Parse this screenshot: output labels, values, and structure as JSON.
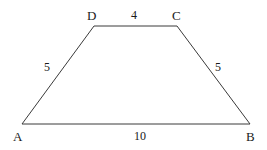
{
  "figure": {
    "type": "geometry-diagram",
    "shape": "trapezoid",
    "background_color": "#ffffff",
    "stroke_color": "#3a3a3a",
    "stroke_width": 1,
    "canvas": {
      "width": 267,
      "height": 150
    },
    "vertices": [
      {
        "name": "A",
        "label": "A",
        "x": 22,
        "y": 124,
        "label_x": 13,
        "label_y": 130
      },
      {
        "name": "B",
        "label": "B",
        "x": 250,
        "y": 124,
        "label_x": 246,
        "label_y": 130
      },
      {
        "name": "C",
        "label": "C",
        "x": 177,
        "y": 26,
        "label_x": 172,
        "label_y": 9
      },
      {
        "name": "D",
        "label": "D",
        "x": 94,
        "y": 26,
        "label_x": 87,
        "label_y": 9
      }
    ],
    "edges": [
      {
        "name": "edge-AB",
        "from": "A",
        "to": "B",
        "length_label": "10",
        "label_x": 134,
        "label_y": 130
      },
      {
        "name": "edge-DC",
        "from": "D",
        "to": "C",
        "length_label": "4",
        "label_x": 131,
        "label_y": 9
      },
      {
        "name": "edge-AD",
        "from": "A",
        "to": "D",
        "length_label": "5",
        "label_x": 44,
        "label_y": 61
      },
      {
        "name": "edge-BC",
        "from": "B",
        "to": "C",
        "length_label": "5",
        "label_x": 215,
        "label_y": 61
      }
    ]
  }
}
